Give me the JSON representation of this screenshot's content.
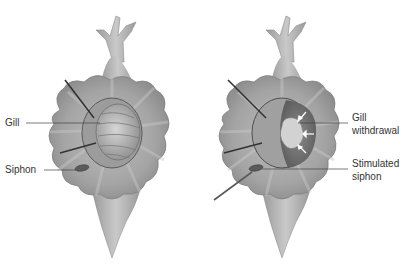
{
  "figure": {
    "panels": [
      {
        "id": "left",
        "state": "before stimulation",
        "labels": [
          {
            "text": "Gill",
            "x": 5,
            "y": 115
          },
          {
            "text": "Siphon",
            "x": 5,
            "y": 162
          }
        ]
      },
      {
        "id": "right",
        "state": "after stimulation",
        "labels": [
          {
            "text": "Gill",
            "x": 352,
            "y": 117
          },
          {
            "text": "withdrawal",
            "x": 352,
            "y": 130
          },
          {
            "text": "Stimulated",
            "x": 352,
            "y": 162
          },
          {
            "text": "siphon",
            "x": 352,
            "y": 175
          }
        ]
      }
    ],
    "colors": {
      "body": "#a9a9a9",
      "body_light": "#cfcfcf",
      "body_dark": "#7d7d7d",
      "mantle_dark": "#6a6a6a",
      "leader_line": "#444444",
      "probe": "#333333",
      "text": "#333333"
    }
  }
}
